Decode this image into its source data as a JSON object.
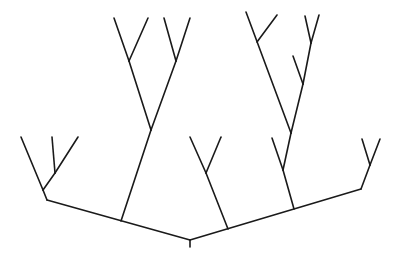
{
  "diagram": {
    "type": "tree",
    "stroke_color": "#1a1a1a",
    "background": "#ffffff",
    "segments": [
      [
        190,
        240,
        190,
        247
      ],
      [
        190,
        240,
        47,
        200
      ],
      [
        190,
        240,
        361,
        189
      ],
      [
        47,
        200,
        43,
        190
      ],
      [
        43,
        190,
        21,
        137
      ],
      [
        43,
        190,
        55,
        173
      ],
      [
        55,
        173,
        52,
        137
      ],
      [
        55,
        173,
        78,
        137
      ],
      [
        121,
        221,
        151,
        130
      ],
      [
        151,
        130,
        129,
        61
      ],
      [
        151,
        130,
        176,
        61
      ],
      [
        129,
        61,
        114,
        18
      ],
      [
        129,
        61,
        148,
        18
      ],
      [
        176,
        61,
        164,
        18
      ],
      [
        176,
        61,
        190,
        18
      ],
      [
        228,
        229,
        206,
        173
      ],
      [
        206,
        173,
        190,
        137
      ],
      [
        206,
        173,
        221,
        137
      ],
      [
        294,
        209,
        283,
        170
      ],
      [
        283,
        170,
        272,
        138
      ],
      [
        283,
        170,
        291,
        133
      ],
      [
        291,
        133,
        246,
        12
      ],
      [
        257,
        42,
        277,
        15
      ],
      [
        291,
        133,
        303,
        84
      ],
      [
        303,
        84,
        293,
        56
      ],
      [
        303,
        84,
        311,
        43
      ],
      [
        311,
        43,
        305,
        16
      ],
      [
        311,
        43,
        319,
        15
      ],
      [
        361,
        189,
        370,
        165
      ],
      [
        370,
        165,
        362,
        139
      ],
      [
        370,
        165,
        380,
        139
      ]
    ]
  }
}
